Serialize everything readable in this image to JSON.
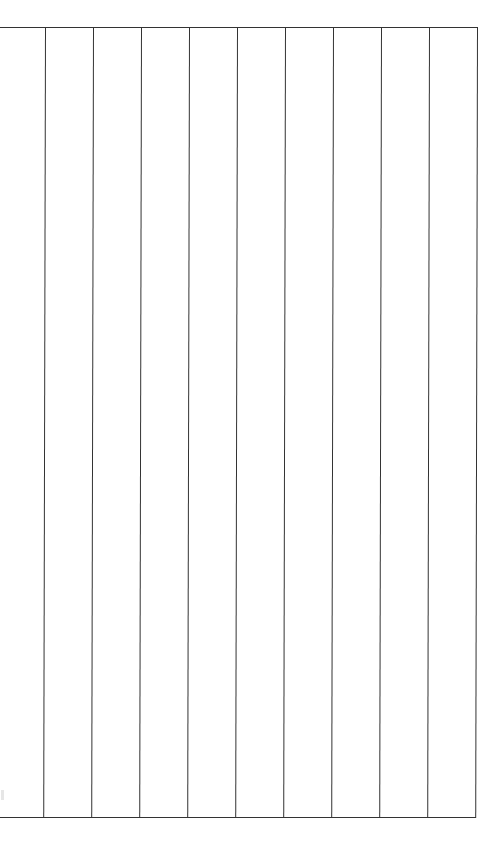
{
  "page": {
    "type": "blank ruled grid sheet",
    "background": "#ffffff",
    "line_color": "#333333"
  },
  "grid": {
    "columns": 10,
    "column_lines_x": [
      46,
      94,
      142,
      190,
      238,
      286,
      334,
      382,
      430,
      478
    ],
    "top_y": 27,
    "bottom_y": 818,
    "has_left_border": false,
    "has_right_border": true
  }
}
